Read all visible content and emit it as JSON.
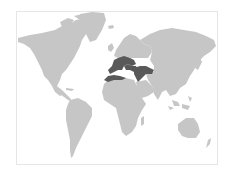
{
  "map": {
    "type": "world-map",
    "colors": {
      "background": "#ffffff",
      "frame_border": "#e6e6e6",
      "land": "#c6c6c6",
      "highlight": "#595959"
    },
    "highlighted_region": "Mediterranean basin (Southern Europe, North Africa coast, Anatolia, Levant, Mesopotamia)"
  }
}
